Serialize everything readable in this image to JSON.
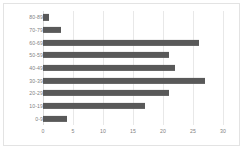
{
  "chart_data": {
    "type": "bar",
    "orientation": "horizontal",
    "title": "",
    "subtitle": "",
    "xlabel": "",
    "ylabel": "",
    "categories": [
      "0-9",
      "10-19",
      "20-29",
      "30-39",
      "40-49",
      "50-59",
      "60-69",
      "70-79",
      "80-89"
    ],
    "values": [
      4,
      17,
      21,
      27,
      22,
      21,
      26,
      3,
      1
    ],
    "xlim": [
      0,
      30
    ],
    "xticks": [
      0,
      5,
      10,
      15,
      20,
      25,
      30
    ],
    "xtick_labels": [
      "0",
      "5",
      "10",
      "15",
      "20",
      "25",
      "30"
    ],
    "grid": true,
    "grid_axis": "x",
    "legend": false,
    "legend_position": "none",
    "bar_color": "#595959",
    "gridline_color": "#e8e8e8",
    "axis_label_color": "#7f7f7f",
    "border_color": "#e3e3e3",
    "background_color": "#ffffff",
    "display_order_top_to_bottom": [
      "80-89",
      "70-79",
      "60-69",
      "50-59",
      "40-49",
      "30-39",
      "20-29",
      "10-19",
      "0-9"
    ]
  }
}
